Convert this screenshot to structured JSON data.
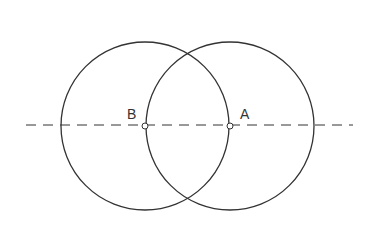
{
  "diagram": {
    "colors": {
      "stroke": "#333333",
      "background": "#ffffff"
    },
    "line": {
      "x1": 26,
      "y1": 125,
      "x2": 353,
      "y2": 125,
      "style": "dashed"
    },
    "circles": [
      {
        "name": "circle-centered-B",
        "cx": 145,
        "cy": 126,
        "r": 84
      },
      {
        "name": "circle-centered-A",
        "cx": 230,
        "cy": 126,
        "r": 84
      }
    ],
    "points": [
      {
        "label": "B",
        "x": 145,
        "y": 126,
        "label_x": 127,
        "label_y": 119
      },
      {
        "label": "A",
        "x": 230,
        "y": 126,
        "label_x": 240,
        "label_y": 119
      }
    ]
  }
}
